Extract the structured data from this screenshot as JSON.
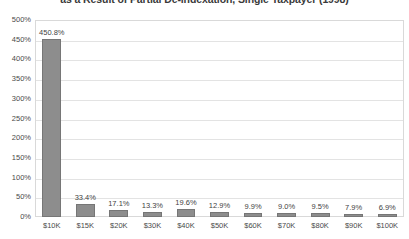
{
  "chart_data": {
    "type": "bar",
    "title": "as a Result of Partial De-indexation, Single Taxpayer (1998)",
    "xlabel": "",
    "ylabel": "",
    "categories": [
      "$10K",
      "$15K",
      "$20K",
      "$30K",
      "$40K",
      "$50K",
      "$60K",
      "$70K",
      "$80K",
      "$90K",
      "$100K"
    ],
    "values": [
      450.8,
      33.4,
      17.1,
      13.3,
      19.6,
      12.9,
      9.9,
      9.0,
      9.5,
      7.9,
      6.9
    ],
    "value_labels": [
      "450.8%",
      "33.4%",
      "17.1%",
      "13.3%",
      "19.6%",
      "12.9%",
      "9.9%",
      "9.0%",
      "9.5%",
      "7.9%",
      "6.9%"
    ],
    "ylim": [
      0,
      500
    ],
    "ytick_values": [
      0,
      50,
      100,
      150,
      200,
      250,
      300,
      350,
      400,
      450,
      500
    ],
    "ytick_labels": [
      "0%",
      "50%",
      "100%",
      "150%",
      "200%",
      "250%",
      "300%",
      "350%",
      "400%",
      "450%",
      "500%"
    ],
    "grid": true,
    "legend": false,
    "legend_position": "none",
    "bar_color": "#8d8d8d",
    "bar_border_color": "#767676",
    "gridline_color": "#e3e3e3",
    "plot_border_color": "#d9d9d9",
    "text_color": "#4a4a4a",
    "title_color": "#3a3a3a",
    "background_color": "#ffffff"
  }
}
